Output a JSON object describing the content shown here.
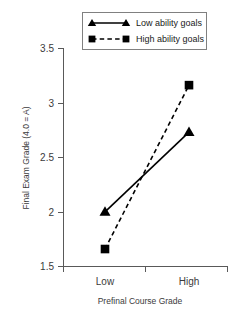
{
  "chart_data": {
    "type": "line",
    "title": "",
    "xlabel": "Prefinal Course Grade",
    "ylabel": "Final Exam Grade (4.0 = A)",
    "categories": [
      "Low",
      "High"
    ],
    "xtick_labels": [
      "Low",
      "High"
    ],
    "ytick_labels": [
      "3.5",
      "3",
      "2.5",
      "2",
      "1.5"
    ],
    "yticks": [
      3.5,
      3,
      2.5,
      2,
      1.5
    ],
    "ylim": [
      1.5,
      3.5
    ],
    "grid": false,
    "legend_position": "top-center",
    "series": [
      {
        "name": "Low ability goals",
        "values": [
          2.0,
          2.73
        ],
        "marker": "triangle",
        "linestyle": "solid",
        "color": "#000000"
      },
      {
        "name": "High ability goals",
        "values": [
          1.66,
          3.16
        ],
        "marker": "square",
        "linestyle": "dashed",
        "color": "#000000"
      }
    ]
  },
  "legend": {
    "items": [
      {
        "label": "Low ability goals",
        "marker": "triangle-marker",
        "linestyle": "solid"
      },
      {
        "label": "High ability goals",
        "marker": "square-marker",
        "linestyle": "dashed"
      }
    ]
  },
  "colors": {
    "ink": "#000000",
    "axis": "#595959",
    "text": "#3b3b3b",
    "legend_border": "#808080",
    "background": "#ffffff"
  }
}
